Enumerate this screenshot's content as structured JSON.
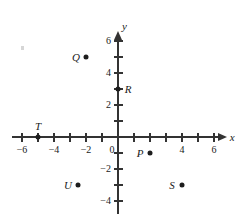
{
  "figure": {
    "kind": "coordinate-plane",
    "axis_names": {
      "x": "x",
      "y": "y"
    },
    "origin_px": {
      "x": 118,
      "y": 137
    },
    "unit_px": 16,
    "axis_color": "#333333",
    "point_color": "#1d1d1d",
    "label_color": "#1a1a1a"
  },
  "chart_data": {
    "type": "scatter",
    "title": "",
    "xlabel": "x",
    "ylabel": "y",
    "xlim": [
      -6.6,
      6.8
    ],
    "ylim": [
      -4.8,
      6.6
    ],
    "grid": false,
    "legend": "none",
    "x_ticks": [
      -6,
      -5,
      -4,
      -3,
      -2,
      -1,
      0,
      1,
      2,
      3,
      4,
      5,
      6
    ],
    "y_ticks": [
      -4,
      -3,
      -2,
      -1,
      1,
      2,
      3,
      4,
      5,
      6
    ],
    "x_tick_labels": [
      {
        "value": -6,
        "text": "−6"
      },
      {
        "value": -4,
        "text": "−4"
      },
      {
        "value": -2,
        "text": "−2"
      },
      {
        "value": 0,
        "text": "0"
      },
      {
        "value": 4,
        "text": "4"
      },
      {
        "value": 6,
        "text": "6"
      }
    ],
    "y_tick_labels": [
      {
        "value": 6,
        "text": "6"
      },
      {
        "value": 4,
        "text": "4"
      },
      {
        "value": 2,
        "text": "2"
      },
      {
        "value": -2,
        "text": "−2"
      },
      {
        "value": -4,
        "text": "−4"
      }
    ],
    "points": [
      {
        "name": "P",
        "x": 2,
        "y": -1,
        "label": "P",
        "label_side": "left"
      },
      {
        "name": "Q",
        "x": -2,
        "y": 5,
        "label": "Q",
        "label_side": "left"
      },
      {
        "name": "R",
        "x": 0,
        "y": 3,
        "label": "R",
        "label_side": "right"
      },
      {
        "name": "S",
        "x": 4,
        "y": -3,
        "label": "S",
        "label_side": "left"
      },
      {
        "name": "T",
        "x": -5,
        "y": 0,
        "label": "T",
        "label_side": "above"
      },
      {
        "name": "U",
        "x": -2.5,
        "y": -3,
        "label": "U",
        "label_side": "left"
      }
    ]
  }
}
